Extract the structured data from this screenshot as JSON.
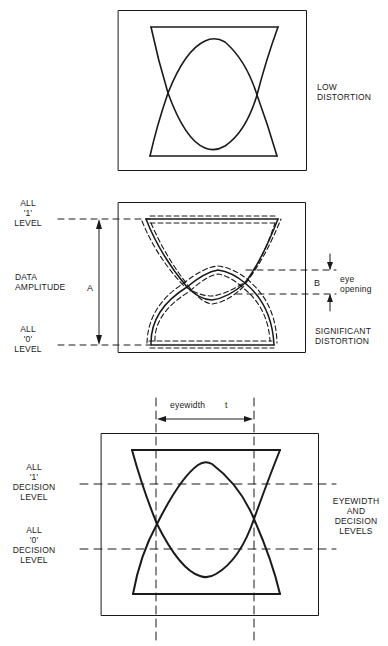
{
  "panels": [
    {
      "id": "low-distortion",
      "caption_lines": [
        "LOW",
        "DISTORTION"
      ]
    },
    {
      "id": "significant-distortion",
      "caption_lines": [
        "SIGNIFICANT",
        "DISTORTION"
      ],
      "all1_level": [
        "ALL",
        "'1'",
        "LEVEL"
      ],
      "all0_level": [
        "ALL",
        "'0'",
        "LEVEL"
      ],
      "data_amplitude": [
        "DATA",
        "AMPLITUDE"
      ],
      "amplitude_symbol": "A",
      "opening_symbol": "B",
      "eye_opening": [
        "eye",
        "opening"
      ]
    },
    {
      "id": "eyewidth-decision",
      "caption_lines": [
        "EYEWIDTH",
        "AND",
        "DECISION",
        "LEVELS"
      ],
      "all1_decision": [
        "ALL",
        "'1'",
        "DECISION",
        "LEVEL"
      ],
      "all0_decision": [
        "ALL",
        "'0'",
        "DECISION",
        "LEVEL"
      ],
      "eyewidth_label": "eyewidth",
      "eyewidth_symbol": "t"
    }
  ],
  "colors": {
    "ink": "#1a1a1a",
    "background": "#ffffff"
  }
}
